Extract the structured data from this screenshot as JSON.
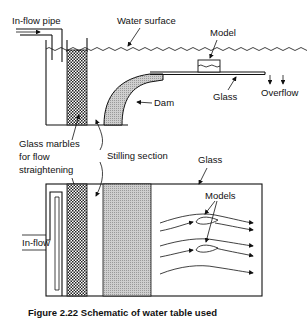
{
  "diagram": {
    "labels": {
      "inflow_pipe": "In-flow pipe",
      "water_surface": "Water surface",
      "model": "Model",
      "glass_top": "Glass",
      "overflow": "Overflow",
      "dam": "Dam",
      "glass_marbles_line1": "Glass marbles",
      "glass_marbles_line2": "for flow",
      "glass_marbles_line3": "straightening",
      "stilling_section": "Stilling section",
      "glass_bottom": "Glass",
      "models": "Models",
      "inflow": "In-flow"
    },
    "caption": "Figure 2.22   Schematic of water table used",
    "colors": {
      "line": "#111111",
      "marbles_fill": "#333333",
      "dam_fill": "#bdbdbd",
      "background": "#ffffff"
    },
    "views": [
      "side-view",
      "top-view"
    ]
  }
}
